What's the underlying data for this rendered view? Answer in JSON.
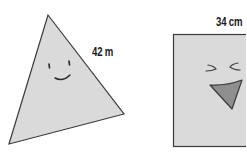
{
  "figures": {
    "triangle": {
      "measurement_label": "42 m",
      "face": "smiling"
    },
    "square": {
      "measurement_label": "34 cm",
      "face": "laughing"
    }
  },
  "colors": {
    "fill": "#dadada",
    "stroke": "#3a3a3a",
    "mouth_fill": "#8f8f8f"
  }
}
